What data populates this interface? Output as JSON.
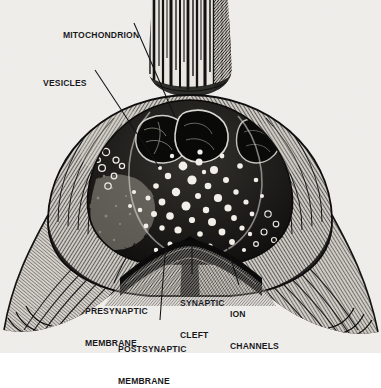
{
  "figure": {
    "style": "black-and-white stipple / line engraving on off-white paper",
    "background_color": "#f4f3f1",
    "ink_color": "#17171a",
    "paper_tint": "#eceae6"
  },
  "labels": [
    {
      "id": "mitochondrion",
      "name": "mitochondrion-label",
      "lines": [
        "MITOCHONDRION"
      ],
      "x": 63,
      "y": 9,
      "leader": {
        "x1": 134,
        "y1": 23,
        "x2": 175,
        "y2": 117
      }
    },
    {
      "id": "vesicles",
      "name": "vesicles-label",
      "lines": [
        "VESICLES"
      ],
      "x": 43,
      "y": 57,
      "leader": {
        "x1": 95,
        "y1": 70,
        "x2": 159,
        "y2": 167
      }
    },
    {
      "id": "presynaptic-membrane",
      "name": "presynaptic-membrane-label",
      "lines": [
        "PRESYNAPTIC",
        "MEMBRANE"
      ],
      "x": 85,
      "y": 285,
      "leader": {
        "x1": 114,
        "y1": 283,
        "x2": 135,
        "y2": 243
      }
    },
    {
      "id": "synaptic-cleft",
      "name": "synaptic-cleft-label",
      "lines": [
        "SYNAPTIC",
        "CLEFT"
      ],
      "x": 180,
      "y": 277,
      "leader": {
        "x1": 192,
        "y1": 274,
        "x2": 192,
        "y2": 243
      }
    },
    {
      "id": "ion-channels",
      "name": "ion-channels-label",
      "lines": [
        "ION",
        "CHANNELS"
      ],
      "x": 230,
      "y": 288,
      "leader": {
        "x1": 239,
        "y1": 285,
        "x2": 226,
        "y2": 243
      }
    },
    {
      "id": "postsynaptic-membrane",
      "name": "postsynaptic-membrane-label",
      "lines": [
        "POSTSYNAPTIC",
        "MEMBRANE"
      ],
      "x": 118,
      "y": 323,
      "leader": {
        "x1": 160,
        "y1": 320,
        "x2": 166,
        "y2": 246
      }
    }
  ],
  "structures": {
    "axon_shaft": "vertical striated axon trunk entering from top center",
    "terminal_bulb": "large bulbous presynaptic terminal occupying center of frame",
    "left_lobe": "hatched left shoulder of terminal",
    "right_lobe": "hatched right shoulder of terminal",
    "vesicle_cluster": "dense field of light round synaptic vesicles in terminal cytoplasm",
    "mitochondria": "two dark lobed mitochondria in upper terminal",
    "cleft": "narrow dark V-shaped gap between membranes at bottom center",
    "postsynaptic_sheet": "broad hatched postsynaptic cell spreading to lower left and lower right"
  }
}
